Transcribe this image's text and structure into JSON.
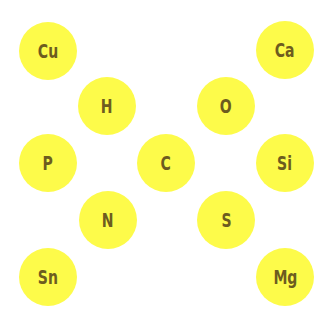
{
  "colors": {
    "node_fill": "#fdfb4a",
    "label": "#6d5c1f",
    "background": "#ffffff"
  },
  "nodes": [
    {
      "symbol": "Cu",
      "x": 48,
      "y": 51
    },
    {
      "symbol": "Ca",
      "x": 285,
      "y": 50
    },
    {
      "symbol": "H",
      "x": 107,
      "y": 106
    },
    {
      "symbol": "O",
      "x": 226,
      "y": 106
    },
    {
      "symbol": "P",
      "x": 48,
      "y": 163
    },
    {
      "symbol": "C",
      "x": 166,
      "y": 163
    },
    {
      "symbol": "Si",
      "x": 285,
      "y": 163
    },
    {
      "symbol": "N",
      "x": 108,
      "y": 220
    },
    {
      "symbol": "S",
      "x": 226,
      "y": 220
    },
    {
      "symbol": "Sn",
      "x": 48,
      "y": 277
    },
    {
      "symbol": "Mg",
      "x": 285,
      "y": 277
    }
  ]
}
